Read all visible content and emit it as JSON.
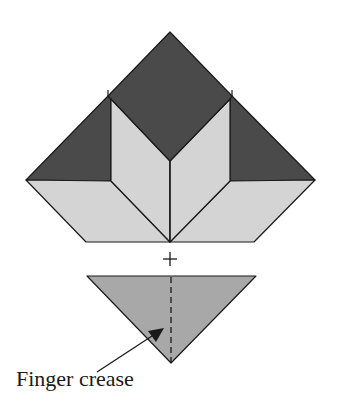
{
  "diagram": {
    "type": "origami-fold-step",
    "colors": {
      "dark": "#4a4a4a",
      "light": "#d4d4d4",
      "medium": "#a8a8a8",
      "stroke": "#1a1a1a"
    },
    "top_model": {
      "description": "Folded model with dark top diamond, two dark side triangles and light lower flaps"
    },
    "join_symbol": "+",
    "bottom_piece": {
      "description": "Medium-gray triangle with vertical dashed crease line"
    },
    "annotation": {
      "label": "Finger crease"
    }
  }
}
